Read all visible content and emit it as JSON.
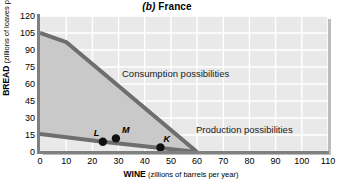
{
  "chart_data": {
    "type": "line",
    "title": "(b) France",
    "title_letter": "(b)",
    "title_name": "France",
    "xlabel_strong": "WINE",
    "xlabel_weak": "(zillions of barrels per year)",
    "ylabel_strong": "BREAD",
    "ylabel_weak": "(zillions of loaves per year)",
    "xlim": [
      0,
      110
    ],
    "ylim": [
      0,
      120
    ],
    "xticks": [
      0,
      10,
      20,
      30,
      40,
      50,
      60,
      70,
      80,
      90,
      100,
      110
    ],
    "yticks": [
      0,
      15,
      30,
      45,
      60,
      75,
      90,
      105,
      120
    ],
    "grid": true,
    "legend_position": "inline-annotations",
    "series": [
      {
        "name": "Consumption possibilities",
        "annotation": "Consumption possibilities",
        "points": [
          [
            0,
            105
          ],
          [
            10,
            97
          ],
          [
            60,
            0
          ]
        ]
      },
      {
        "name": "Production possibilities",
        "annotation": "Production possibilities",
        "points": [
          [
            0,
            16
          ],
          [
            24,
            9
          ],
          [
            60,
            0
          ]
        ]
      }
    ],
    "markers": [
      {
        "label": "L",
        "x": 24,
        "y": 9
      },
      {
        "label": "M",
        "x": 29,
        "y": 12
      },
      {
        "label": "K",
        "x": 46,
        "y": 4
      }
    ],
    "shaded_region": {
      "name": "gains-from-trade",
      "color": "#c9c9c9",
      "description": "Area between production possibilities and consumption possibilities lines"
    },
    "colors": {
      "plot_background": "#e9e9e9",
      "grid": "#ffffff",
      "line": "#6e6e6e",
      "axis": "#808080",
      "text": "#000000",
      "marker": "#111111"
    }
  }
}
